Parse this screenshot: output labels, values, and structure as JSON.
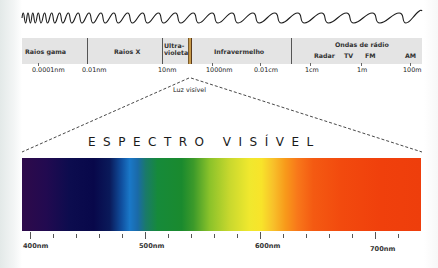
{
  "electromagnetic_spectrum": {
    "bands": [
      {
        "label": "Raios gama"
      },
      {
        "label": "Raios X"
      },
      {
        "label": "Ultra-\nvioleta"
      },
      {
        "label": "Infravermelho"
      },
      {
        "label": "Ondas de rádio"
      }
    ],
    "radio_subbands": [
      "Radar",
      "TV",
      "FM",
      "AM"
    ],
    "scale_labels": [
      "0.0001nm",
      "0.01nm",
      "10nm",
      "1000nm",
      "0.01cm",
      "1cm",
      "1m",
      "100m"
    ],
    "visible_callout": "Luz visível"
  },
  "visible_spectrum": {
    "title": "ESPECTRO VISÍVEL",
    "axis_labels": [
      "400nm",
      "500nm",
      "600nm",
      "700nm"
    ],
    "range_nm": [
      400,
      740
    ],
    "minor_tick_step_nm": 20,
    "colors": {
      "violet": "#2e0a4a",
      "indigo": "#08084a",
      "blue": "#1a78c8",
      "green": "#1a8a2e",
      "yellow": "#f8e42a",
      "orange": "#f8781a",
      "red": "#ee3e0c"
    }
  }
}
